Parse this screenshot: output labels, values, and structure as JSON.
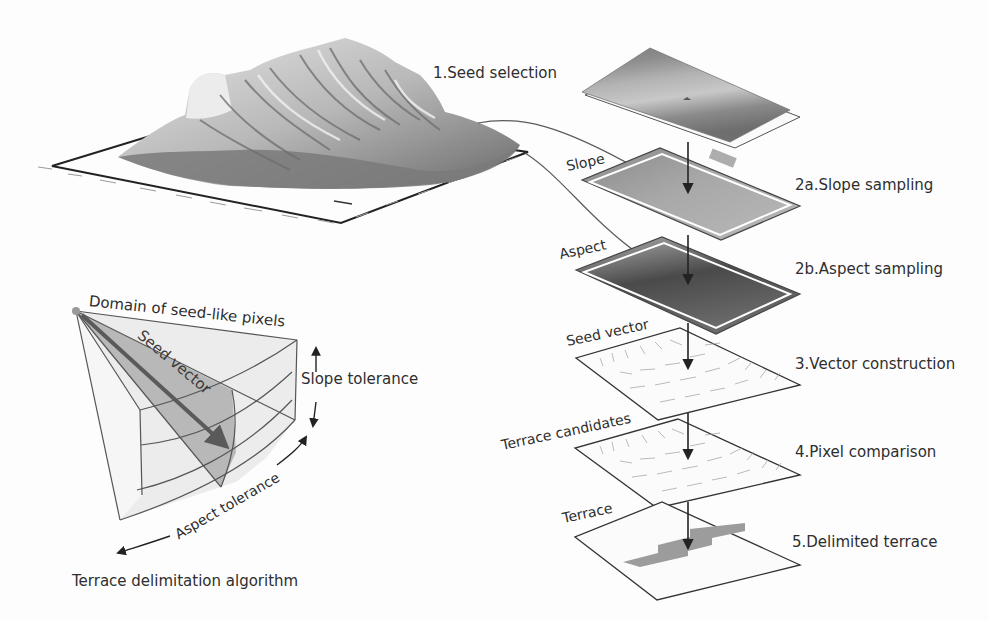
{
  "figure": {
    "title": "Terrace delimitation algorithm",
    "colors": {
      "background": "#fdfdfd",
      "line": "#3a3a3a",
      "terrain_dark": "#6e6e6e",
      "terrain_light": "#d9d9d9",
      "terrace_fill": "#9c9c9c",
      "cone_fill": "#ececec",
      "cone_highlight": "#b5b5b5"
    }
  },
  "steps": [
    {
      "id": "1",
      "label": "1.Seed selection",
      "layer": "DEM surface with seed point"
    },
    {
      "id": "2a",
      "label": "2a.Slope sampling",
      "layer_label": "Slope"
    },
    {
      "id": "2b",
      "label": "2b.Aspect sampling",
      "layer_label": "Aspect"
    },
    {
      "id": "3",
      "label": "3.Vector construction",
      "layer_label": "Seed vector"
    },
    {
      "id": "4",
      "label": "4.Pixel comparison",
      "layer_label": "Terrace candidates"
    },
    {
      "id": "5",
      "label": "5.Delimited terrace",
      "layer_label": "Terrace"
    }
  ],
  "cone": {
    "domain_label": "Domain of seed-like pixels",
    "vector_label": "Seed vector",
    "slope_tolerance_label": "Slope tolerance",
    "aspect_tolerance_label": "Aspect tolerance",
    "caption": "Terrace delimitation algorithm"
  }
}
